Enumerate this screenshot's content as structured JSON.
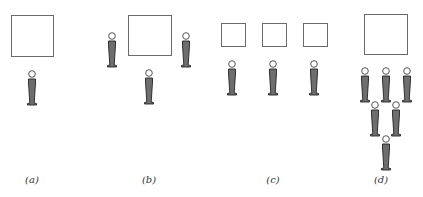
{
  "figure": {
    "panels": [
      {
        "id": "a",
        "label": "(a)",
        "label_x": 32,
        "boxes": [
          {
            "x": 11,
            "y": 15,
            "w": 43,
            "h": 42
          }
        ],
        "persons": [
          {
            "cx": 32,
            "top": 70
          }
        ]
      },
      {
        "id": "b",
        "label": "(b)",
        "label_x": 149,
        "boxes": [
          {
            "x": 128,
            "y": 15,
            "w": 44,
            "h": 41
          }
        ],
        "persons": [
          {
            "cx": 112,
            "top": 32
          },
          {
            "cx": 149,
            "top": 69
          },
          {
            "cx": 186,
            "top": 32
          }
        ]
      },
      {
        "id": "c",
        "label": "(c)",
        "label_x": 273,
        "boxes": [
          {
            "x": 221,
            "y": 23,
            "w": 25,
            "h": 24
          },
          {
            "x": 262,
            "y": 23,
            "w": 25,
            "h": 24
          },
          {
            "x": 303,
            "y": 23,
            "w": 25,
            "h": 24
          }
        ],
        "persons": [
          {
            "cx": 232,
            "top": 60
          },
          {
            "cx": 273,
            "top": 60
          },
          {
            "cx": 314,
            "top": 60
          }
        ]
      },
      {
        "id": "d",
        "label": "(d)",
        "label_x": 381,
        "boxes": [
          {
            "x": 364,
            "y": 14,
            "w": 44,
            "h": 41
          }
        ],
        "persons": [
          {
            "cx": 365,
            "top": 67
          },
          {
            "cx": 386,
            "top": 67
          },
          {
            "cx": 407,
            "top": 67
          },
          {
            "cx": 375,
            "top": 101
          },
          {
            "cx": 396,
            "top": 101
          },
          {
            "cx": 386,
            "top": 135
          }
        ]
      }
    ],
    "label_y": 174,
    "colors": {
      "box_border": "#6a6a6a",
      "body_fill": "#6e6e6e",
      "body_stroke": "#222222",
      "head_stroke": "#555555"
    }
  }
}
